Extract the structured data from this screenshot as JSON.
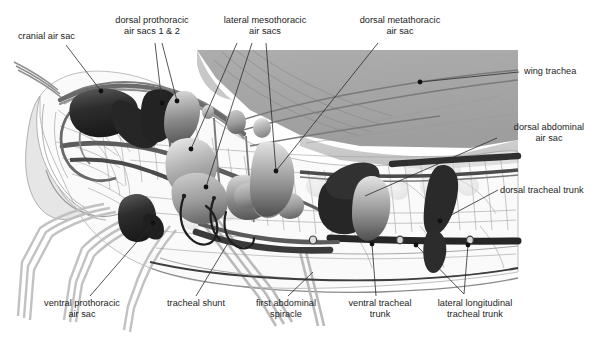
{
  "figure": {
    "background_color": "#ffffff",
    "width": 609,
    "height": 341
  },
  "palette": {
    "ink": "#1c1c1c",
    "leader_line": "#2b2b2b",
    "dot": "#111111",
    "wing_gray": "#a9a9a9",
    "wing_gray_light": "#c4c4c4",
    "body_outline": "#777777",
    "body_fill": "#f2f2f2",
    "trachea_dark": "#3a3a3a",
    "trachea_mid": "#6e6e6e",
    "trachea_light": "#b6b6b6",
    "sac_dark": "#2e2e2e",
    "sac_mid": "#8a8a8a",
    "sac_light": "#d2d2d2",
    "leg_gray": "#bdbdbd"
  },
  "labels": [
    {
      "id": "cranial-air-sac",
      "text": "cranial air sac",
      "lines": [
        "cranial air sac"
      ],
      "align": "left",
      "x": 18,
      "y": 31,
      "width": 90,
      "leaders": [
        [
          [
            66,
            45
          ],
          [
            101,
            91
          ]
        ]
      ],
      "dots": [
        [
          101,
          91
        ]
      ]
    },
    {
      "id": "dorsal-prothoracic-air-sacs",
      "text": "dorsal prothoracic air sacs 1 & 2",
      "lines": [
        "dorsal prothoracic",
        "air sacs 1 & 2"
      ],
      "align": "center",
      "x": 104,
      "y": 15,
      "width": 96,
      "leaders": [
        [
          [
            155,
            43
          ],
          [
            162,
            103
          ]
        ],
        [
          [
            162,
            43
          ],
          [
            177,
            101
          ]
        ]
      ],
      "dots": [
        [
          162,
          103
        ],
        [
          177,
          101
        ]
      ]
    },
    {
      "id": "lateral-mesothoracic-air-sacs",
      "text": "lateral mesothoracic air sacs",
      "lines": [
        "lateral mesothoracic",
        "air sacs"
      ],
      "align": "center",
      "x": 213,
      "y": 15,
      "width": 104,
      "leaders": [
        [
          [
            237,
            43
          ],
          [
            191,
            149
          ]
        ],
        [
          [
            252,
            43
          ],
          [
            206,
            187
          ]
        ],
        [
          [
            266,
            43
          ],
          [
            276,
            171
          ]
        ]
      ],
      "dots": [
        [
          191,
          149
        ],
        [
          206,
          187
        ],
        [
          276,
          171
        ]
      ]
    },
    {
      "id": "dorsal-metathoracic-air-sac",
      "text": "dorsal metathoracic air sac",
      "lines": [
        "dorsal metathoracic",
        "air sac"
      ],
      "align": "center",
      "x": 348,
      "y": 15,
      "width": 104,
      "leaders": [
        [
          [
            378,
            43
          ],
          [
            276,
            171
          ]
        ]
      ],
      "dots": []
    },
    {
      "id": "wing-trachea",
      "text": "wing trachea",
      "lines": [
        "wing trachea"
      ],
      "align": "left",
      "x": 524,
      "y": 66,
      "width": 80,
      "leaders": [
        [
          [
            519,
            72
          ],
          [
            420,
            82
          ]
        ]
      ],
      "dots": [
        [
          420,
          82
        ]
      ]
    },
    {
      "id": "dorsal-abdominal-air-sac",
      "text": "dorsal abdominal air sac",
      "lines": [
        "dorsal abdominal",
        "air sac"
      ],
      "align": "center",
      "x": 497,
      "y": 122,
      "width": 104,
      "leaders": [
        [
          [
            497,
            138
          ],
          [
            365,
            196
          ]
        ]
      ],
      "dots": []
    },
    {
      "id": "dorsal-tracheal-trunk",
      "text": "dorsal tracheal trunk",
      "lines": [
        "dorsal tracheal trunk"
      ],
      "align": "left",
      "x": 500,
      "y": 185,
      "width": 108,
      "leaders": [
        [
          [
            498,
            190
          ],
          [
            440,
            221
          ]
        ]
      ],
      "dots": [
        [
          440,
          221
        ]
      ]
    },
    {
      "id": "ventral-prothoracic-air-sac",
      "text": "ventral prothoracic air sac",
      "lines": [
        "ventral prothoracic",
        "air sac"
      ],
      "align": "center",
      "x": 30,
      "y": 298,
      "width": 104,
      "leaders": [
        [
          [
            90,
            296
          ],
          [
            153,
            223
          ]
        ]
      ],
      "dots": [
        [
          153,
          223
        ]
      ]
    },
    {
      "id": "tracheal-shunt",
      "text": "tracheal shunt",
      "lines": [
        "tracheal shunt"
      ],
      "align": "center",
      "x": 151,
      "y": 298,
      "width": 90,
      "leaders": [
        [
          [
            196,
            296
          ],
          [
            228,
            243
          ]
        ]
      ],
      "dots": []
    },
    {
      "id": "first-abdominal-spiracle",
      "text": "first abdominal spiracle",
      "lines": [
        "first abdominal",
        "spiracle"
      ],
      "align": "center",
      "x": 240,
      "y": 298,
      "width": 92,
      "leaders": [
        [
          [
            288,
            296
          ],
          [
            313,
            272
          ]
        ]
      ],
      "dots": []
    },
    {
      "id": "ventral-tracheal-trunk",
      "text": "ventral tracheal trunk",
      "lines": [
        "ventral tracheal",
        "trunk"
      ],
      "align": "center",
      "x": 338,
      "y": 298,
      "width": 84,
      "leaders": [
        [
          [
            376,
            296
          ],
          [
            372,
            244
          ]
        ]
      ],
      "dots": [
        [
          372,
          244
        ]
      ]
    },
    {
      "id": "lateral-longitudinal-tracheal-trunk",
      "text": "lateral longitudinal tracheal trunk",
      "lines": [
        "lateral longitudinal",
        "tracheal trunk"
      ],
      "align": "center",
      "x": 423,
      "y": 298,
      "width": 104,
      "leaders": [
        [
          [
            464,
            294
          ],
          [
            416,
            245
          ]
        ],
        [
          [
            464,
            294
          ],
          [
            468,
            245
          ]
        ]
      ],
      "dots": [
        [
          416,
          245
        ],
        [
          468,
          245
        ]
      ]
    }
  ],
  "anatomy": {
    "structures": [
      "wing membrane",
      "head capsule",
      "foreleg",
      "midleg",
      "hindleg",
      "thoracic air sacs",
      "abdominal air sacs",
      "dorsal tracheal trunk",
      "ventral tracheal trunk",
      "lateral longitudinal tracheal trunk",
      "tracheal shunt loops",
      "spiracles",
      "fine tracheole network"
    ]
  }
}
